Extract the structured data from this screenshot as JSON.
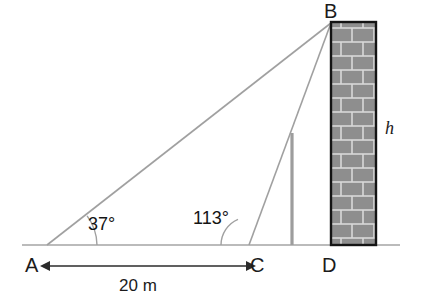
{
  "figure": {
    "background_color": "#ffffff",
    "line_color": "#9a9a9a",
    "dimension_color": "#2b2b2b",
    "wall_outline_color": "#1a1a1a",
    "brick_fill_color": "#8c8c8c",
    "mortar_color": "#d8d8d8"
  },
  "vertices": {
    "A": {
      "label": "A",
      "x": 47,
      "y": 245
    },
    "B": {
      "label": "B",
      "x": 331,
      "y": 22
    },
    "C": {
      "label": "C",
      "x": 249,
      "y": 245
    },
    "D": {
      "label": "D",
      "x": 331,
      "y": 245
    }
  },
  "angles": [
    {
      "name": "angle-at-a",
      "label": "37°",
      "value": 37,
      "unit": "degrees",
      "at_vertex": "A"
    },
    {
      "name": "angle-at-c",
      "label": "113°",
      "value": 113,
      "unit": "degrees",
      "at_vertex": "C"
    }
  ],
  "dimensions": [
    {
      "name": "baseline-ac",
      "label": "20 m",
      "value": 20,
      "unit": "m",
      "from": "A",
      "to": "C",
      "style": "double-arrow"
    }
  ],
  "unknowns": [
    {
      "name": "wall-height",
      "label": "h",
      "description": "height of wall BD"
    }
  ],
  "wall": {
    "name": "brick-wall",
    "left": 331,
    "top": 22,
    "width": 45,
    "height": 223,
    "brick_rows": 16,
    "brick_width": 22
  },
  "pole": {
    "name": "vertical-pole",
    "x": 292,
    "top": 133,
    "bottom": 245
  },
  "ground": {
    "name": "ground-line",
    "x1": 22,
    "x2": 400,
    "y": 245
  }
}
